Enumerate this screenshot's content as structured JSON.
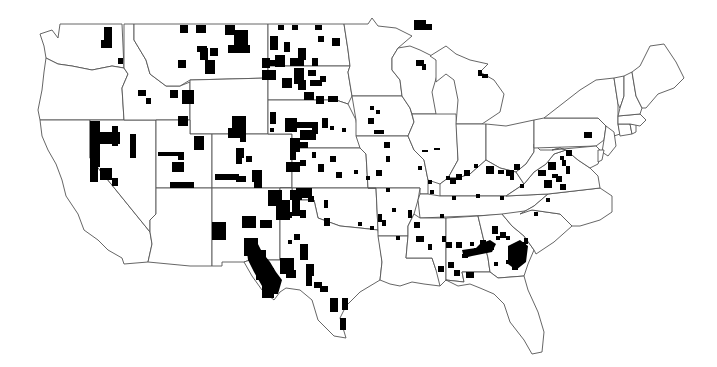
{
  "map": {
    "type": "choropleth",
    "region": "contiguous-united-states",
    "colors": {
      "background": "#ffffff",
      "state_fill": "#ffffff",
      "state_stroke": "#555555",
      "highlight": "#000000"
    },
    "states": [
      {
        "name": "WA",
        "d": "M40,34 L52,30 L58,38 L60,24 L122,24 L124,68 L112,66 L92,70 L72,66 L58,64 L46,58 L44,46 Z"
      },
      {
        "name": "OR",
        "d": "M46,58 L58,64 L72,66 L92,70 L112,66 L124,68 L128,74 L122,88 L124,120 L40,120 L38,110 L42,90 L44,72 Z"
      },
      {
        "name": "CA",
        "d": "M40,120 L90,120 L90,158 L150,232 L152,244 L148,262 L124,264 L122,258 L108,250 L98,240 L84,230 L78,214 L66,196 L62,180 L56,164 L48,150 L42,136 Z"
      },
      {
        "name": "NV",
        "d": "M90,120 L156,120 L156,214 L150,220 L150,232 L90,158 Z"
      },
      {
        "name": "ID",
        "d": "M124,24 L134,24 L134,40 L146,60 L150,74 L166,86 L180,86 L190,82 L190,120 L124,120 L122,88 L128,74 L124,68 Z"
      },
      {
        "name": "MT",
        "d": "M134,24 L268,24 L268,78 L190,80 L180,86 L166,86 L150,74 L146,60 L134,40 Z"
      },
      {
        "name": "WY",
        "d": "M190,80 L268,78 L268,134 L190,134 Z"
      },
      {
        "name": "UT",
        "d": "M156,120 L190,120 L190,134 L212,134 L212,188 L156,188 Z"
      },
      {
        "name": "AZ",
        "d": "M156,188 L212,188 L212,266 L190,266 L148,262 L152,244 L150,232 L150,220 L156,214 Z"
      },
      {
        "name": "CO",
        "d": "M212,134 L292,134 L292,188 L212,188 Z"
      },
      {
        "name": "NM",
        "d": "M212,188 L280,188 L280,260 L250,260 L244,262 L222,262 L222,266 L212,266 Z"
      },
      {
        "name": "ND",
        "d": "M268,24 L344,24 L348,50 L350,66 L268,66 Z"
      },
      {
        "name": "SD",
        "d": "M268,66 L350,66 L348,72 L352,96 L348,104 L336,100 L268,100 Z"
      },
      {
        "name": "NE",
        "d": "M268,100 L336,100 L348,104 L356,120 L360,148 L292,148 L292,134 L268,134 Z"
      },
      {
        "name": "KS",
        "d": "M292,148 L360,148 L366,154 L368,188 L292,188 Z"
      },
      {
        "name": "OK",
        "d": "M280,188 L376,188 L378,230 L360,228 L340,226 L318,218 L314,200 L292,200 L292,188 Z"
      },
      {
        "name": "TX",
        "d": "M280,188 L292,188 L292,200 L314,200 L318,218 L340,226 L360,228 L378,230 L382,262 L380,280 L360,292 L346,306 L340,318 L346,338 L334,336 L318,320 L312,300 L300,290 L286,288 L280,292 L274,300 L262,290 L252,276 L244,262 L250,260 L280,260 Z"
      },
      {
        "name": "MN",
        "d": "M344,24 L368,24 L372,18 L378,26 L396,28 L412,36 L398,48 L392,58 L392,70 L400,80 L402,96 L352,96 L348,72 L350,66 L348,50 Z"
      },
      {
        "name": "IA",
        "d": "M352,96 L402,96 L410,108 L414,122 L408,136 L356,136 L356,120 Z"
      },
      {
        "name": "MO",
        "d": "M356,136 L408,136 L414,150 L424,160 L428,180 L428,194 L420,194 L420,188 L368,188 L366,154 L360,148 Z"
      },
      {
        "name": "AR",
        "d": "M368,188 L420,188 L418,200 L414,214 L408,226 L408,236 L378,236 L378,230 L376,188 Z"
      },
      {
        "name": "LA",
        "d": "M378,236 L408,236 L406,258 L432,258 L436,270 L444,278 L440,286 L424,284 L412,282 L400,286 L390,284 L380,280 L382,262 Z"
      },
      {
        "name": "WI",
        "d": "M398,48 L410,46 L420,50 L436,58 L438,72 L432,92 L436,114 L412,114 L410,108 L402,96 L400,80 L392,70 L392,58 Z"
      },
      {
        "name": "IL",
        "d": "M412,114 L456,114 L458,160 L448,178 L440,184 L428,180 L424,160 L414,150 L408,136 L414,122 Z"
      },
      {
        "name": "MI",
        "d": "M430,56 L446,46 L456,54 L470,60 L488,64 L480,72 L494,80 L504,94 L500,112 L482,124 L456,124 L458,100 L454,80 L446,74 L436,82 L436,60 Z"
      },
      {
        "name": "IN",
        "d": "M456,124 L486,124 L486,160 L470,174 L458,178 L448,178 L458,160 Z"
      },
      {
        "name": "OH",
        "d": "M486,124 L506,126 L534,120 L534,152 L526,164 L516,172 L500,168 L486,160 Z"
      },
      {
        "name": "KY",
        "d": "M440,184 L448,178 L458,178 L470,174 L486,160 L500,168 L516,172 L524,184 L506,196 L440,196 Z"
      },
      {
        "name": "TN",
        "d": "M420,194 L428,194 L440,196 L506,196 L548,194 L534,206 L520,214 L420,218 L418,200 Z"
      },
      {
        "name": "MS",
        "d": "M414,214 L420,218 L446,218 L446,280 L440,286 L436,270 L432,258 L406,258 L408,236 L408,226 Z"
      },
      {
        "name": "AL",
        "d": "M446,218 L478,216 L488,258 L490,272 L462,272 L464,282 L446,280 Z"
      },
      {
        "name": "GA",
        "d": "M478,216 L502,214 L512,226 L524,236 L534,250 L528,264 L524,276 L498,278 L490,272 L488,258 Z"
      },
      {
        "name": "FL",
        "d": "M446,280 L464,282 L462,272 L490,272 L498,278 L524,276 L528,290 L538,312 L544,332 L542,352 L532,354 L524,340 L510,322 L504,304 L494,294 L480,288 L470,284 L458,286 Z"
      },
      {
        "name": "SC",
        "d": "M502,214 L532,210 L560,214 L572,226 L554,242 L536,254 L534,250 L524,236 L512,226 Z"
      },
      {
        "name": "NC",
        "d": "M520,214 L534,206 L548,194 L600,188 L612,196 L612,212 L600,220 L580,226 L572,226 L560,214 L532,210 Z"
      },
      {
        "name": "VA",
        "d": "M506,196 L524,184 L534,172 L546,164 L554,154 L566,150 L578,160 L590,168 L598,176 L600,188 L548,194 Z"
      },
      {
        "name": "WV",
        "d": "M516,172 L526,164 L534,152 L534,144 L540,150 L552,150 L560,148 L566,150 L554,154 L546,164 L534,172 L524,184 Z"
      },
      {
        "name": "PA",
        "d": "M534,120 L544,118 L598,118 L606,126 L604,140 L596,146 L534,148 Z"
      },
      {
        "name": "NY",
        "d": "M544,118 L562,104 L580,90 L596,80 L614,78 L618,104 L618,124 L620,134 L608,138 L606,126 L598,118 Z"
      },
      {
        "name": "MD",
        "d": "M552,150 L596,146 L602,152 L598,164 L590,168 L578,160 L566,150 L560,148 Z"
      },
      {
        "name": "NJ",
        "d": "M604,140 L606,126 L614,132 L616,146 L608,156 L602,152 Z"
      },
      {
        "name": "DE",
        "d": "M598,150 L604,150 L602,160 L598,162 Z"
      },
      {
        "name": "CT",
        "d": "M618,124 L630,124 L632,134 L620,136 Z"
      },
      {
        "name": "RI",
        "d": "M630,124 L636,124 L636,132 L632,134 Z"
      },
      {
        "name": "MA",
        "d": "M618,116 L640,114 L646,120 L640,126 L630,124 L618,124 Z"
      },
      {
        "name": "VT",
        "d": "M614,78 L624,76 L624,96 L620,108 L618,104 Z"
      },
      {
        "name": "NH",
        "d": "M624,76 L632,72 L636,96 L642,108 L640,114 L618,116 L620,108 L624,96 Z"
      },
      {
        "name": "ME",
        "d": "M632,72 L640,66 L650,46 L664,44 L676,62 L684,78 L674,88 L658,94 L646,108 L642,108 L636,96 Z"
      }
    ],
    "highlighted_counties": [
      [
        104,
        27,
        8,
        14
      ],
      [
        101,
        40,
        11,
        8
      ],
      [
        118,
        58,
        5,
        6
      ],
      [
        180,
        25,
        8,
        8
      ],
      [
        196,
        25,
        10,
        8
      ],
      [
        225,
        25,
        10,
        10
      ],
      [
        234,
        30,
        14,
        15
      ],
      [
        228,
        45,
        22,
        8
      ],
      [
        210,
        48,
        8,
        8
      ],
      [
        200,
        48,
        8,
        12
      ],
      [
        205,
        60,
        10,
        14
      ],
      [
        178,
        60,
        8,
        8
      ],
      [
        197,
        46,
        10,
        6
      ],
      [
        278,
        25,
        6,
        5
      ],
      [
        292,
        25,
        6,
        5
      ],
      [
        315,
        25,
        7,
        5
      ],
      [
        270,
        36,
        8,
        14
      ],
      [
        275,
        55,
        10,
        12
      ],
      [
        284,
        42,
        6,
        10
      ],
      [
        262,
        58,
        8,
        10
      ],
      [
        262,
        70,
        14,
        10
      ],
      [
        270,
        60,
        14,
        6
      ],
      [
        290,
        58,
        14,
        8
      ],
      [
        298,
        48,
        8,
        12
      ],
      [
        294,
        68,
        10,
        16
      ],
      [
        298,
        80,
        8,
        10
      ],
      [
        310,
        80,
        12,
        6
      ],
      [
        320,
        76,
        6,
        6
      ],
      [
        312,
        58,
        6,
        8
      ],
      [
        332,
        38,
        8,
        8
      ],
      [
        318,
        36,
        6,
        6
      ],
      [
        308,
        70,
        8,
        6
      ],
      [
        282,
        78,
        10,
        10
      ],
      [
        304,
        92,
        10,
        8
      ],
      [
        316,
        96,
        8,
        8
      ],
      [
        328,
        96,
        10,
        6
      ],
      [
        138,
        90,
        8,
        6
      ],
      [
        146,
        98,
        5,
        6
      ],
      [
        170,
        90,
        8,
        8
      ],
      [
        182,
        90,
        12,
        14
      ],
      [
        178,
        116,
        10,
        10
      ],
      [
        232,
        116,
        14,
        18
      ],
      [
        228,
        128,
        18,
        10
      ],
      [
        240,
        136,
        6,
        6
      ],
      [
        270,
        112,
        6,
        12
      ],
      [
        270,
        128,
        4,
        4
      ],
      [
        285,
        118,
        12,
        14
      ],
      [
        296,
        122,
        22,
        6
      ],
      [
        300,
        130,
        16,
        10
      ],
      [
        290,
        138,
        10,
        14
      ],
      [
        300,
        142,
        8,
        6
      ],
      [
        312,
        128,
        6,
        6
      ],
      [
        322,
        118,
        6,
        10
      ],
      [
        330,
        126,
        4,
        4
      ],
      [
        342,
        128,
        4,
        4
      ],
      [
        290,
        150,
        6,
        10
      ],
      [
        286,
        162,
        14,
        10
      ],
      [
        300,
        160,
        6,
        6
      ],
      [
        312,
        152,
        4,
        6
      ],
      [
        318,
        164,
        6,
        8
      ],
      [
        330,
        156,
        6,
        6
      ],
      [
        336,
        172,
        6,
        6
      ],
      [
        354,
        170,
        4,
        4
      ],
      [
        90,
        121,
        10,
        46
      ],
      [
        98,
        132,
        22,
        12
      ],
      [
        112,
        126,
        6,
        20
      ],
      [
        130,
        134,
        6,
        24
      ],
      [
        90,
        160,
        8,
        22
      ],
      [
        100,
        168,
        12,
        12
      ],
      [
        112,
        178,
        6,
        8
      ],
      [
        158,
        152,
        24,
        4
      ],
      [
        178,
        152,
        6,
        8
      ],
      [
        172,
        162,
        12,
        10
      ],
      [
        170,
        182,
        24,
        6
      ],
      [
        194,
        136,
        10,
        14
      ],
      [
        196,
        138,
        6,
        8
      ],
      [
        236,
        148,
        8,
        10
      ],
      [
        236,
        158,
        6,
        6
      ],
      [
        246,
        156,
        6,
        6
      ],
      [
        215,
        174,
        24,
        6
      ],
      [
        236,
        176,
        10,
        6
      ],
      [
        252,
        170,
        10,
        12
      ],
      [
        254,
        180,
        8,
        8
      ],
      [
        268,
        190,
        14,
        16
      ],
      [
        276,
        200,
        14,
        20
      ],
      [
        290,
        190,
        12,
        10
      ],
      [
        292,
        200,
        8,
        16
      ],
      [
        300,
        210,
        6,
        8
      ],
      [
        296,
        188,
        16,
        10
      ],
      [
        308,
        196,
        6,
        6
      ],
      [
        242,
        216,
        14,
        12
      ],
      [
        260,
        220,
        12,
        8
      ],
      [
        286,
        212,
        6,
        6
      ],
      [
        278,
        212,
        8,
        6
      ],
      [
        212,
        222,
        14,
        18
      ],
      [
        244,
        238,
        14,
        18
      ],
      [
        256,
        250,
        10,
        30
      ],
      [
        262,
        268,
        12,
        30
      ],
      [
        280,
        258,
        14,
        16
      ],
      [
        286,
        270,
        10,
        8
      ],
      [
        288,
        240,
        4,
        4
      ],
      [
        294,
        234,
        6,
        6
      ],
      [
        300,
        244,
        8,
        16
      ],
      [
        306,
        264,
        8,
        12
      ],
      [
        306,
        276,
        6,
        10
      ],
      [
        314,
        282,
        8,
        6
      ],
      [
        320,
        286,
        8,
        6
      ],
      [
        330,
        298,
        8,
        14
      ],
      [
        342,
        298,
        6,
        12
      ],
      [
        340,
        318,
        6,
        12
      ],
      [
        324,
        200,
        4,
        8
      ],
      [
        324,
        218,
        6,
        8
      ],
      [
        358,
        222,
        4,
        4
      ],
      [
        370,
        226,
        4,
        4
      ],
      [
        392,
        208,
        4,
        4
      ],
      [
        370,
        106,
        4,
        4
      ],
      [
        376,
        110,
        4,
        4
      ],
      [
        368,
        118,
        6,
        6
      ],
      [
        374,
        130,
        6,
        4
      ],
      [
        380,
        130,
        4,
        4
      ],
      [
        384,
        142,
        6,
        6
      ],
      [
        386,
        156,
        4,
        6
      ],
      [
        376,
        170,
        6,
        6
      ],
      [
        366,
        176,
        4,
        4
      ],
      [
        386,
        188,
        4,
        4
      ],
      [
        378,
        214,
        4,
        8
      ],
      [
        382,
        220,
        4,
        6
      ],
      [
        416,
        60,
        8,
        6
      ],
      [
        422,
        64,
        4,
        6
      ],
      [
        478,
        70,
        4,
        6
      ],
      [
        482,
        74,
        6,
        4
      ],
      [
        422,
        150,
        6,
        2
      ],
      [
        434,
        148,
        6,
        2
      ],
      [
        418,
        166,
        4,
        4
      ],
      [
        428,
        180,
        4,
        4
      ],
      [
        414,
        20,
        12,
        10
      ],
      [
        422,
        24,
        10,
        6
      ],
      [
        430,
        190,
        4,
        4
      ],
      [
        446,
        176,
        4,
        4
      ],
      [
        450,
        178,
        6,
        6
      ],
      [
        456,
        174,
        6,
        6
      ],
      [
        464,
        170,
        6,
        6
      ],
      [
        474,
        164,
        4,
        4
      ],
      [
        486,
        166,
        8,
        8
      ],
      [
        498,
        170,
        6,
        4
      ],
      [
        506,
        170,
        8,
        6
      ],
      [
        514,
        164,
        6,
        6
      ],
      [
        510,
        176,
        4,
        4
      ],
      [
        520,
        184,
        4,
        4
      ],
      [
        538,
        170,
        8,
        6
      ],
      [
        548,
        162,
        8,
        8
      ],
      [
        552,
        174,
        6,
        4
      ],
      [
        544,
        180,
        8,
        8
      ],
      [
        556,
        176,
        6,
        6
      ],
      [
        560,
        184,
        6,
        6
      ],
      [
        562,
        160,
        4,
        6
      ],
      [
        560,
        156,
        4,
        4
      ],
      [
        566,
        166,
        4,
        8
      ],
      [
        584,
        132,
        8,
        6
      ],
      [
        566,
        150,
        6,
        6
      ],
      [
        440,
        214,
        4,
        4
      ],
      [
        452,
        196,
        4,
        4
      ],
      [
        476,
        194,
        4,
        4
      ],
      [
        500,
        196,
        4,
        4
      ],
      [
        534,
        212,
        4,
        4
      ],
      [
        546,
        198,
        4,
        4
      ],
      [
        416,
        236,
        8,
        6
      ],
      [
        428,
        244,
        4,
        6
      ],
      [
        396,
        236,
        4,
        4
      ],
      [
        408,
        210,
        4,
        8
      ],
      [
        414,
        222,
        6,
        6
      ],
      [
        442,
        236,
        4,
        6
      ],
      [
        446,
        242,
        6,
        6
      ],
      [
        456,
        242,
        6,
        6
      ],
      [
        462,
        254,
        6,
        4
      ],
      [
        438,
        266,
        6,
        6
      ],
      [
        448,
        262,
        6,
        6
      ],
      [
        470,
        242,
        4,
        4
      ],
      [
        474,
        248,
        6,
        6
      ],
      [
        454,
        270,
        6,
        6
      ],
      [
        466,
        272,
        8,
        6
      ],
      [
        480,
        240,
        6,
        6
      ],
      [
        482,
        246,
        6,
        6
      ],
      [
        488,
        246,
        6,
        4
      ],
      [
        492,
        226,
        6,
        8
      ],
      [
        496,
        236,
        4,
        4
      ],
      [
        500,
        232,
        6,
        6
      ],
      [
        506,
        236,
        4,
        4
      ],
      [
        508,
        248,
        6,
        6
      ],
      [
        510,
        252,
        8,
        6
      ],
      [
        516,
        256,
        8,
        4
      ],
      [
        520,
        242,
        6,
        6
      ],
      [
        524,
        238,
        4,
        6
      ],
      [
        512,
        264,
        6,
        6
      ],
      [
        494,
        262,
        4,
        4
      ],
      [
        506,
        260,
        4,
        4
      ]
    ],
    "special_shapes": [
      {
        "name": "sw-texas-border-band",
        "d": "M246,244 L256,240 L262,252 L270,262 L276,272 L282,280 L278,294 L270,294 L262,286 L254,272 L248,260 Z"
      },
      {
        "name": "georgia-alabama-band",
        "d": "M462,250 L476,248 L480,244 L490,240 L496,244 L492,252 L482,254 L472,256 L464,258 Z"
      },
      {
        "name": "georgia-east-cluster",
        "d": "M508,246 L520,240 L528,246 L526,262 L516,270 L508,264 Z"
      }
    ]
  }
}
